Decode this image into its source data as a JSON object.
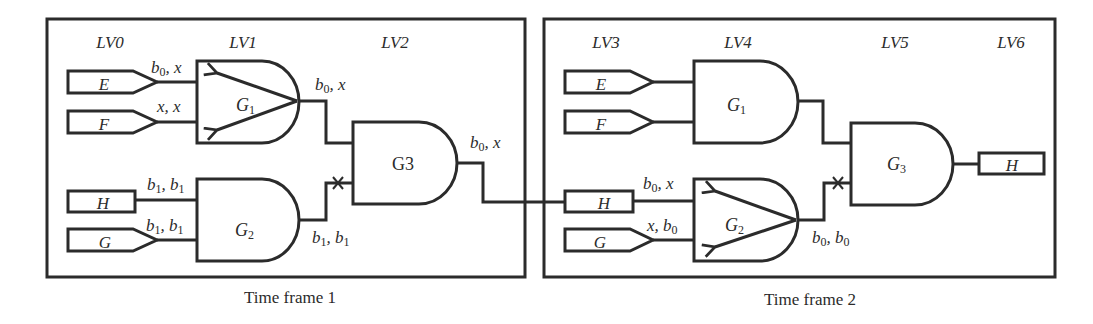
{
  "colors": {
    "stroke": "#2b2b2b",
    "background": "#ffffff"
  },
  "frame1": {
    "caption": "Time frame 1",
    "levels": {
      "lv0": "LV0",
      "lv1": "LV1",
      "lv2": "LV2"
    },
    "inputs": {
      "e": "E",
      "f": "F",
      "h": "H",
      "g": "G"
    },
    "gates": {
      "g1": {
        "name": "G",
        "sub": "1"
      },
      "g2": {
        "name": "G",
        "sub": "2"
      },
      "g3": {
        "name": "G3",
        "sub": ""
      }
    },
    "wire_labels": {
      "e_to_g1": {
        "a": "b",
        "a_sub": "0",
        "sep": ", ",
        "b": "x",
        "b_sub": ""
      },
      "f_to_g1": {
        "a": "x",
        "a_sub": "",
        "sep": ", ",
        "b": "x",
        "b_sub": ""
      },
      "g1_out": {
        "a": "b",
        "a_sub": "0",
        "sep": ", ",
        "b": "x",
        "b_sub": ""
      },
      "h_to_g2": {
        "a": "b",
        "a_sub": "1",
        "sep": ", ",
        "b": "b",
        "b_sub": "1"
      },
      "g_to_g2": {
        "a": "b",
        "a_sub": "1",
        "sep": ", ",
        "b": "b",
        "b_sub": "1"
      },
      "g2_out": {
        "a": "b",
        "a_sub": "1",
        "sep": ", ",
        "b": "b",
        "b_sub": "1"
      },
      "g3_out": {
        "a": "b",
        "a_sub": "0",
        "sep": ", ",
        "b": "x",
        "b_sub": ""
      }
    }
  },
  "frame2": {
    "caption": "Time frame 2",
    "levels": {
      "lv3": "LV3",
      "lv4": "LV4",
      "lv5": "LV5",
      "lv6": "LV6"
    },
    "inputs": {
      "e": "E",
      "f": "F",
      "h": "H",
      "g": "G"
    },
    "outputs": {
      "h": "H"
    },
    "gates": {
      "g1": {
        "name": "G",
        "sub": "1"
      },
      "g2": {
        "name": "G",
        "sub": "2"
      },
      "g3": {
        "name": "G",
        "sub": "3"
      }
    },
    "wire_labels": {
      "h_to_g2": {
        "a": "b",
        "a_sub": "0",
        "sep": ", ",
        "b": "x",
        "b_sub": ""
      },
      "g_to_g2": {
        "a": "x",
        "a_sub": "",
        "sep": ", ",
        "b": "b",
        "b_sub": "0"
      },
      "g2_out": {
        "a": "b",
        "a_sub": "0",
        "sep": ", ",
        "b": "b",
        "b_sub": "0"
      }
    }
  }
}
